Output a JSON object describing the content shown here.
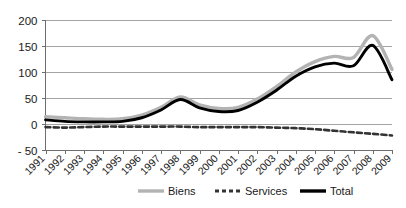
{
  "chart_data": {
    "type": "line",
    "title": "",
    "subtitle": "",
    "xlabel": "",
    "ylabel": "",
    "categories": [
      "1991",
      "1992",
      "1993",
      "1994",
      "1995",
      "1996",
      "1997",
      "1998",
      "1999",
      "2000",
      "2001",
      "2002",
      "2003",
      "2004",
      "2005",
      "2006",
      "2007",
      "2008",
      "2009"
    ],
    "ylim": [
      -50,
      200
    ],
    "yticks": [
      -50,
      0,
      50,
      100,
      150,
      200
    ],
    "ytick_labels": [
      "- 50",
      "0",
      "50",
      "100",
      "150",
      "200"
    ],
    "grid": "horizontal",
    "legend_position": "bottom",
    "series": [
      {
        "name": "Biens",
        "style": "solid",
        "color": "#b3b3b3",
        "values": [
          14,
          12,
          10,
          9,
          10,
          17,
          32,
          52,
          37,
          30,
          32,
          48,
          72,
          100,
          120,
          130,
          128,
          170,
          105
        ]
      },
      {
        "name": "Services",
        "style": "dashed",
        "color": "#333333",
        "values": [
          -6,
          -7,
          -6,
          -5,
          -5,
          -5,
          -5,
          -5,
          -6,
          -6,
          -6,
          -6,
          -7,
          -8,
          -10,
          -13,
          -16,
          -19,
          -22
        ]
      },
      {
        "name": "Total",
        "style": "solid",
        "color": "#000000",
        "values": [
          8,
          5,
          4,
          4,
          5,
          12,
          27,
          47,
          31,
          24,
          26,
          42,
          65,
          92,
          110,
          117,
          112,
          151,
          85
        ]
      }
    ]
  },
  "legend": {
    "items": [
      {
        "label": "Biens"
      },
      {
        "label": "Services"
      },
      {
        "label": "Total"
      }
    ]
  }
}
